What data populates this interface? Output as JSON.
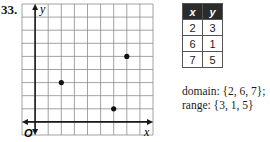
{
  "problem": {
    "number": "33."
  },
  "chart_data": {
    "type": "scatter",
    "title": "",
    "xlabel": "x",
    "ylabel": "y",
    "origin_label": "O",
    "grid": true,
    "x_range": [
      -1,
      9
    ],
    "y_range": [
      -1,
      9
    ],
    "points": [
      {
        "x": 2,
        "y": 3
      },
      {
        "x": 6,
        "y": 1
      },
      {
        "x": 7,
        "y": 5
      }
    ],
    "tick_labels": false
  },
  "table": {
    "headers": [
      "x",
      "y"
    ],
    "rows": [
      [
        "2",
        "3"
      ],
      [
        "6",
        "1"
      ],
      [
        "7",
        "5"
      ]
    ]
  },
  "caption": {
    "domain": "domain: {2, 6, 7};",
    "range": "range: {3, 1, 5}"
  },
  "colors": {
    "grid": "#8c8c8c",
    "axis": "#1a1a1a",
    "point": "#111111",
    "header_bg": "#2b2b2b"
  }
}
